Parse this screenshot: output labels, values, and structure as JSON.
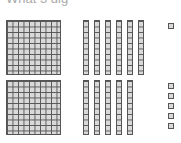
{
  "header": {
    "text": "What 3 dig"
  },
  "base_ten_blocks": {
    "rows": [
      {
        "hundreds": 1,
        "tens": 6,
        "ones": 1,
        "value": 161
      },
      {
        "hundreds": 1,
        "tens": 5,
        "ones": 5,
        "value": 155
      }
    ],
    "total": {
      "hundreds": 2,
      "tens": 11,
      "ones": 6,
      "value": 316
    },
    "colors": {
      "block_fill": "#d9d9d9",
      "block_line": "#555555"
    }
  }
}
